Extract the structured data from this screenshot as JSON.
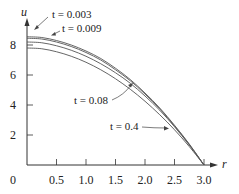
{
  "chart_data": {
    "type": "line",
    "title": "",
    "xlabel": "r",
    "ylabel": "u",
    "xlim": [
      0,
      3.0
    ],
    "ylim": [
      0,
      9
    ],
    "grid": false,
    "legend": "inline annotations with leader arrows",
    "x_ticks": [
      "0",
      "0.5",
      "1.0",
      "1.5",
      "2.0",
      "2.5",
      "3.0"
    ],
    "y_ticks": [
      "2",
      "4",
      "6",
      "8"
    ],
    "x": [
      0,
      0.25,
      0.5,
      0.75,
      1.0,
      1.25,
      1.5,
      1.75,
      2.0,
      2.25,
      2.5,
      2.75,
      3.0
    ],
    "series": [
      {
        "name": "t = 0.003",
        "values": [
          8.55,
          8.5,
          8.3,
          8.0,
          7.6,
          7.1,
          6.45,
          5.7,
          4.8,
          3.8,
          2.65,
          1.4,
          0
        ]
      },
      {
        "name": "t = 0.009",
        "values": [
          8.45,
          8.4,
          8.2,
          7.9,
          7.5,
          7.0,
          6.35,
          5.62,
          4.73,
          3.74,
          2.6,
          1.37,
          0
        ]
      },
      {
        "name": "t = 0.08",
        "values": [
          8.2,
          8.15,
          7.95,
          7.65,
          7.25,
          6.75,
          6.15,
          5.45,
          4.6,
          3.65,
          2.55,
          1.33,
          0
        ]
      },
      {
        "name": "t = 0.4",
        "values": [
          7.8,
          7.75,
          7.55,
          7.25,
          6.85,
          6.35,
          5.75,
          5.05,
          4.25,
          3.35,
          2.35,
          1.23,
          0
        ]
      }
    ],
    "annotations": [
      {
        "text": "t = 0.003",
        "series": 0
      },
      {
        "text": "t = 0.009",
        "series": 1
      },
      {
        "text": "t = 0.08",
        "series": 2
      },
      {
        "text": "t = 0.4",
        "series": 3
      }
    ]
  },
  "labels": {
    "origin": "0",
    "x_axis": "r",
    "y_axis": "u"
  },
  "colors": {
    "curve": "#555555",
    "axis": "#333333",
    "text": "#222222"
  }
}
